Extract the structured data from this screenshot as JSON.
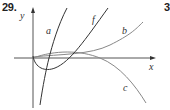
{
  "problem": {
    "number": "29.",
    "next_number_partial": "3"
  },
  "axes": {
    "x_label": "x",
    "y_label": "y"
  },
  "curves": [
    {
      "label": "a",
      "color": "#333333",
      "description": "steep increasing curve"
    },
    {
      "label": "f",
      "color": "#333333",
      "description": "dips below x-axis near origin then increases"
    },
    {
      "label": "b",
      "color": "#888888",
      "description": "slowly increasing curve"
    },
    {
      "label": "c",
      "color": "#888888",
      "description": "rises slightly then decreases"
    }
  ],
  "colors": {
    "axis": "#555555",
    "dark_curve": "#333333",
    "light_curve": "#888888",
    "background": "#ffffff"
  }
}
